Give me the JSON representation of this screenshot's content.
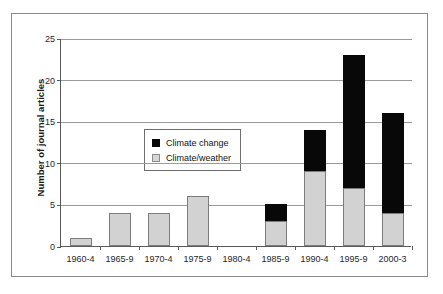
{
  "chart_data": {
    "type": "bar",
    "subtype": "stacked",
    "title": "",
    "xlabel": "",
    "ylabel": "Number of journal articles",
    "ylim": [
      0,
      25
    ],
    "yticks": [
      0,
      5,
      10,
      15,
      20,
      25
    ],
    "grid": true,
    "legend_position": "inside upper-left",
    "categories": [
      "1960-4",
      "1965-9",
      "1970-4",
      "1975-9",
      "1980-4",
      "1985-9",
      "1990-4",
      "1995-9",
      "2000-3"
    ],
    "series": [
      {
        "name": "Climate/weather",
        "color": "#d2d2d2",
        "values": [
          1,
          4,
          4,
          6,
          0,
          3,
          9,
          7,
          4
        ]
      },
      {
        "name": "Climate change",
        "color": "#080808",
        "values": [
          0,
          0,
          0,
          0,
          0,
          2,
          5,
          16,
          12
        ]
      }
    ],
    "totals": [
      1,
      4,
      4,
      6,
      0,
      5,
      14,
      23,
      16
    ]
  },
  "legend": {
    "entries": [
      {
        "label": "Climate change",
        "swatch": "black-square-icon"
      },
      {
        "label": "Climate/weather",
        "swatch": "gray-square-icon"
      }
    ]
  },
  "axis": {
    "y_title": "Number of journal articles",
    "y_tick_labels": [
      "25",
      "20",
      "15",
      "10",
      "5",
      "0"
    ],
    "x_tick_labels": [
      "1960-4",
      "1965-9",
      "1970-4",
      "1975-9",
      "1980-4",
      "1985-9",
      "1990-4",
      "1995-9",
      "2000-3"
    ]
  }
}
